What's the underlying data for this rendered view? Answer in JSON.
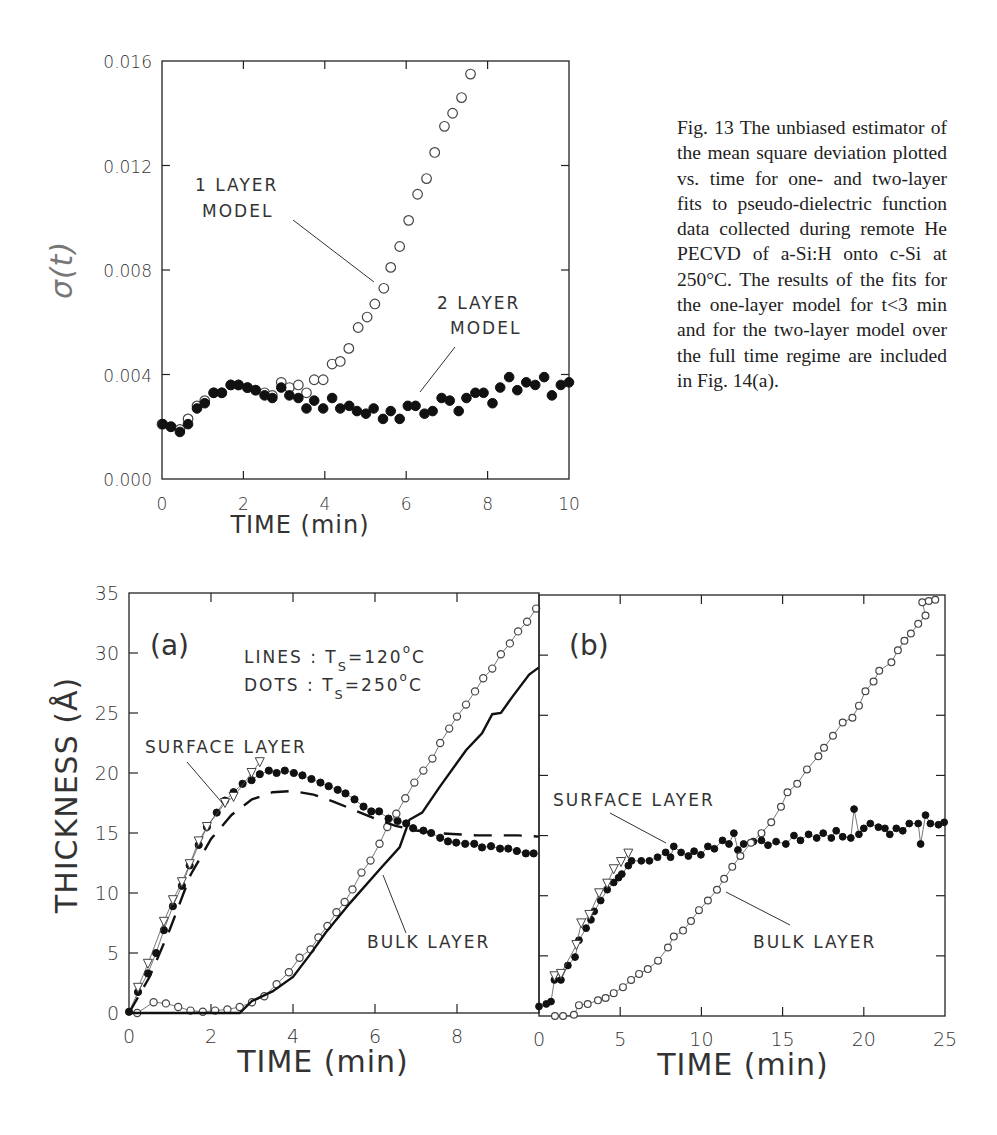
{
  "caption": "Fig. 13    The unbiased estimator of the mean square deviation plotted vs. time for one- and two-layer fits to pseudo-dielectric function data collected during remote He PECVD of a-Si:H onto c-Si at 250°C. The results of the fits for the one-layer model for t<3 min and for the two-layer model over the full time regime are included in Fig. 14(a).",
  "chart_data": [
    {
      "id": "fig13",
      "type": "scatter",
      "title": "",
      "xlabel": "TIME (min)",
      "ylabel": "σ(t)",
      "xlim": [
        0,
        10
      ],
      "ylim": [
        0.0,
        0.016
      ],
      "xticks": [
        0,
        2,
        4,
        6,
        8,
        10
      ],
      "xtick_labels": [
        "0",
        "2",
        "4",
        "6",
        "8",
        "10"
      ],
      "yticks": [
        0.0,
        0.004,
        0.008,
        0.012,
        0.016
      ],
      "ytick_labels": [
        "0.000",
        "0.004",
        "0.008",
        "0.012",
        "0.016"
      ],
      "grid": false,
      "annotations": [
        {
          "text": [
            "1 LAYER",
            "MODEL"
          ],
          "points_to": "1 layer model"
        },
        {
          "text": [
            "2 LAYER",
            "MODEL"
          ],
          "points_to": "2 layer model"
        }
      ],
      "series": [
        {
          "name": "1 layer model",
          "marker": "open-circle",
          "x": [
            0.0,
            0.22,
            0.44,
            0.64,
            0.86,
            1.05,
            1.27,
            1.47,
            1.69,
            1.88,
            2.1,
            2.3,
            2.52,
            2.71,
            2.93,
            3.13,
            3.35,
            3.55,
            3.74,
            3.96,
            4.18,
            4.38,
            4.59,
            4.82,
            5.04,
            5.23,
            5.45,
            5.62,
            5.84,
            6.06,
            6.28,
            6.5,
            6.7,
            6.94,
            7.14,
            7.36,
            7.58
          ],
          "y": [
            0.0021,
            0.002,
            0.0019,
            0.0023,
            0.0028,
            0.003,
            0.0033,
            0.0033,
            0.0036,
            0.0036,
            0.0035,
            0.0034,
            0.0033,
            0.0032,
            0.0037,
            0.0035,
            0.0036,
            0.0033,
            0.0038,
            0.0038,
            0.0044,
            0.0045,
            0.005,
            0.0058,
            0.0062,
            0.0067,
            0.0073,
            0.0081,
            0.0089,
            0.0099,
            0.0109,
            0.0115,
            0.0125,
            0.0135,
            0.014,
            0.0146,
            0.0155
          ]
        },
        {
          "name": "2 layer model",
          "marker": "filled-circle",
          "x": [
            0.02,
            0.22,
            0.44,
            0.64,
            0.86,
            1.05,
            1.27,
            1.47,
            1.69,
            1.88,
            2.1,
            2.3,
            2.52,
            2.71,
            2.93,
            3.13,
            3.35,
            3.55,
            3.74,
            3.96,
            4.18,
            4.38,
            4.6,
            4.79,
            5.01,
            5.2,
            5.43,
            5.62,
            5.84,
            6.04,
            6.23,
            6.45,
            6.65,
            6.87,
            7.07,
            7.29,
            7.48,
            7.7,
            7.9,
            8.12,
            8.31,
            8.53,
            8.73,
            8.95,
            9.17,
            9.39,
            9.58,
            9.8,
            10.0
          ],
          "y": [
            0.0021,
            0.002,
            0.0018,
            0.0021,
            0.0027,
            0.0029,
            0.0033,
            0.0033,
            0.0036,
            0.0036,
            0.0035,
            0.0034,
            0.0032,
            0.0031,
            0.0035,
            0.0032,
            0.0031,
            0.0027,
            0.003,
            0.0027,
            0.0031,
            0.0027,
            0.0028,
            0.0026,
            0.0025,
            0.0027,
            0.0023,
            0.0026,
            0.0023,
            0.0028,
            0.0028,
            0.0025,
            0.0026,
            0.0031,
            0.003,
            0.0026,
            0.0031,
            0.0033,
            0.0033,
            0.0029,
            0.0035,
            0.0039,
            0.0034,
            0.0037,
            0.0036,
            0.0039,
            0.0032,
            0.0036,
            0.0037
          ]
        }
      ]
    },
    {
      "id": "fig14a",
      "type": "line",
      "panel_label": "(a)",
      "xlabel": "TIME (min)",
      "ylabel": "THICKNESS (Å)",
      "xlim": [
        0,
        10
      ],
      "ylim": [
        0,
        35
      ],
      "xticks": [
        0,
        2,
        4,
        6,
        8,
        10
      ],
      "xtick_labels": [
        "0",
        "2",
        "4",
        "6",
        "8",
        "0"
      ],
      "yticks": [
        0,
        5,
        10,
        15,
        20,
        25,
        30,
        35
      ],
      "ytick_labels": [
        "0",
        "5",
        "10",
        "15",
        "20",
        "25",
        "30",
        "35"
      ],
      "grid": false,
      "legend_text": [
        {
          "label": "LINES",
          "sep": ":",
          "var": "T",
          "sub": "S",
          "eq": "=120",
          "deg": "o",
          "unit": "C"
        },
        {
          "label": "DOTS",
          "sep": ":",
          "var": "T",
          "sub": "S",
          "eq": "=250",
          "deg": "o",
          "unit": "C"
        }
      ],
      "annotations": [
        {
          "text": "SURFACE LAYER"
        },
        {
          "text": "BULK LAYER"
        }
      ],
      "series": [
        {
          "name": "surface layer, 250°C (dots)",
          "marker": "filled-circle",
          "x": [
            0.0,
            0.22,
            0.46,
            0.66,
            0.85,
            1.07,
            1.29,
            1.48,
            1.7,
            1.9,
            2.14,
            2.34,
            2.55,
            2.77,
            2.99,
            3.19,
            3.41,
            3.6,
            3.8,
            4.02,
            4.23,
            4.45,
            4.67,
            4.87,
            5.09,
            5.28,
            5.5,
            5.72,
            5.91,
            6.1,
            6.33,
            6.55,
            6.76,
            6.93,
            7.18,
            7.37,
            7.59,
            7.78,
            7.98,
            8.2,
            8.42,
            8.61,
            8.83,
            9.05,
            9.25,
            9.46,
            9.68,
            9.87
          ],
          "y": [
            0.1,
            1.75,
            3.3,
            5.0,
            6.9,
            8.9,
            10.6,
            12.3,
            14.0,
            15.5,
            16.7,
            17.7,
            18.4,
            19.1,
            19.4,
            19.9,
            20.2,
            20.0,
            20.2,
            20.0,
            19.8,
            19.5,
            19.2,
            18.9,
            18.6,
            18.3,
            17.8,
            17.2,
            16.8,
            16.8,
            16.2,
            16.0,
            15.8,
            15.4,
            15.2,
            15.0,
            14.6,
            14.3,
            14.2,
            14.1,
            14.1,
            13.8,
            13.9,
            13.7,
            13.7,
            13.5,
            13.3,
            13.3
          ]
        },
        {
          "name": "surface layer, 250°C (open triangles)",
          "marker": "open-triangle",
          "x": [
            0.22,
            0.46,
            0.85,
            1.07,
            1.29,
            1.48,
            1.7,
            1.9,
            2.34,
            2.55,
            2.99,
            3.19
          ],
          "y": [
            2.1,
            4.1,
            7.6,
            9.4,
            10.9,
            12.4,
            14.3,
            15.5,
            17.5,
            18.0,
            20.0,
            20.9
          ]
        },
        {
          "name": "bulk layer, 250°C (dots)",
          "marker": "open-circle",
          "x": [
            0.2,
            0.6,
            0.9,
            1.2,
            1.5,
            1.8,
            2.1,
            2.4,
            2.7,
            3.0,
            3.3,
            3.6,
            3.9,
            4.16,
            4.43,
            4.62,
            4.84,
            5.06,
            5.26,
            5.45,
            5.67,
            5.89,
            6.11,
            6.3,
            6.52,
            6.74,
            6.96,
            7.18,
            7.4,
            7.59,
            7.81,
            8.0,
            8.22,
            8.44,
            8.64,
            8.86,
            9.07,
            9.29,
            9.49,
            9.71,
            9.93
          ],
          "y": [
            0.0,
            0.9,
            0.8,
            0.5,
            0.2,
            0.1,
            0.2,
            0.3,
            0.5,
            0.9,
            1.4,
            2.4,
            3.4,
            4.6,
            5.3,
            6.3,
            7.25,
            8.4,
            9.25,
            10.3,
            11.7,
            12.7,
            14.1,
            15.5,
            16.6,
            17.9,
            19.2,
            20.2,
            21.2,
            22.5,
            23.7,
            24.7,
            25.7,
            26.8,
            27.9,
            28.7,
            29.9,
            30.8,
            31.8,
            32.6,
            33.7
          ]
        },
        {
          "name": "surface layer, 120°C (lines)",
          "line": "dashed",
          "x": [
            0.0,
            0.5,
            1.0,
            1.5,
            2.0,
            2.5,
            3.0,
            3.5,
            4.0,
            4.5,
            5.0,
            5.5,
            6.0,
            6.5,
            7.0,
            7.5,
            8.0,
            8.5,
            9.0,
            9.5,
            10.0
          ],
          "y": [
            0.0,
            3.0,
            7.0,
            11.5,
            14.5,
            16.5,
            17.8,
            18.4,
            18.5,
            18.2,
            17.6,
            16.9,
            16.2,
            15.6,
            15.2,
            15.0,
            14.9,
            14.8,
            14.8,
            14.8,
            14.7
          ]
        },
        {
          "name": "bulk layer, 120°C (lines)",
          "line": "solid",
          "x": [
            0.0,
            2.7,
            3.0,
            3.5,
            4.0,
            4.4,
            4.8,
            5.4,
            6.15,
            6.6,
            6.84,
            7.15,
            7.57,
            8.22,
            8.61,
            8.86,
            9.07,
            9.34,
            9.76,
            10.0
          ],
          "y": [
            0.0,
            0.0,
            1.0,
            1.8,
            3.0,
            4.8,
            6.7,
            9.2,
            12.1,
            13.8,
            16.1,
            16.7,
            18.8,
            21.9,
            23.3,
            24.9,
            25.0,
            26.3,
            28.2,
            28.8
          ]
        }
      ]
    },
    {
      "id": "fig14b",
      "type": "line",
      "panel_label": "(b)",
      "xlabel": "TIME (min)",
      "ylabel": "THICKNESS (Å)",
      "xlim": [
        0,
        25
      ],
      "ylim": [
        0,
        35
      ],
      "xticks": [
        0,
        5,
        10,
        15,
        20,
        25
      ],
      "xtick_labels": [
        "0",
        "5",
        "10",
        "15",
        "20",
        "25"
      ],
      "yticks": [
        0,
        5,
        10,
        15,
        20,
        25,
        30,
        35
      ],
      "grid": false,
      "annotations": [
        {
          "text": "SURFACE LAYER"
        },
        {
          "text": "BULK LAYER"
        }
      ],
      "series": [
        {
          "name": "surface layer (filled)",
          "marker": "filled-circle",
          "x": [
            0.0,
            0.45,
            0.74,
            0.95,
            1.35,
            1.78,
            2.22,
            2.46,
            2.9,
            3.2,
            3.4,
            3.8,
            4.2,
            4.6,
            4.9,
            5.1,
            5.5,
            5.7,
            6.3,
            6.8,
            7.3,
            7.8,
            8.1,
            8.3,
            8.75,
            9.2,
            9.55,
            9.97,
            10.4,
            10.8,
            11.3,
            11.7,
            12.0,
            12.25,
            12.6,
            13.2,
            13.7,
            14.1,
            14.6,
            15.2,
            15.7,
            16.1,
            16.6,
            17.1,
            17.5,
            18.0,
            18.3,
            18.7,
            19.2,
            19.4,
            19.7,
            20.0,
            20.4,
            20.9,
            21.3,
            21.6,
            22.0,
            22.4,
            22.8,
            23.35,
            23.5,
            23.8,
            24.1,
            24.6,
            24.95
          ],
          "y": [
            0.8,
            1.0,
            1.2,
            3.0,
            3.0,
            4.2,
            4.9,
            6.3,
            7.3,
            8.0,
            8.7,
            9.6,
            10.5,
            11.1,
            11.5,
            11.8,
            12.5,
            12.9,
            12.9,
            12.9,
            13.2,
            13.6,
            13.2,
            14.1,
            13.6,
            13.3,
            13.7,
            13.4,
            14.1,
            13.9,
            14.6,
            14.3,
            15.2,
            13.8,
            14.3,
            14.5,
            14.6,
            14.2,
            14.5,
            14.3,
            15.0,
            14.6,
            15.1,
            14.8,
            15.2,
            14.8,
            15.4,
            14.9,
            14.8,
            17.2,
            15.1,
            15.6,
            16.0,
            15.7,
            15.6,
            15.1,
            15.6,
            15.4,
            16.0,
            16.0,
            14.3,
            16.7,
            16.0,
            15.9,
            16.1
          ]
        },
        {
          "name": "surface layer (open triangles)",
          "marker": "open-triangle",
          "x": [
            0.95,
            1.35,
            2.3,
            2.6,
            3.1,
            3.7,
            4.2,
            4.6,
            5.05,
            5.5
          ],
          "y": [
            3.3,
            3.5,
            5.9,
            7.7,
            8.4,
            10.2,
            11.0,
            12.2,
            12.8,
            13.5
          ]
        },
        {
          "name": "bulk layer (open circles)",
          "marker": "open-circle",
          "x": [
            0.98,
            1.48,
            2.15,
            2.46,
            3.0,
            3.63,
            4.1,
            4.6,
            5.17,
            5.67,
            6.16,
            6.7,
            7.33,
            7.94,
            8.3,
            8.87,
            9.36,
            9.85,
            10.4,
            10.96,
            11.4,
            11.9,
            12.4,
            13.05,
            13.7,
            14.3,
            14.9,
            15.3,
            15.9,
            16.5,
            17.2,
            17.55,
            18.1,
            18.7,
            19.3,
            19.7,
            20.1,
            20.6,
            20.95,
            21.7,
            22.1,
            22.5,
            22.9,
            23.35,
            23.8,
            23.6,
            24.0,
            24.4
          ],
          "y": [
            0.0,
            0.0,
            0.1,
            0.9,
            1.0,
            1.3,
            1.5,
            1.9,
            2.4,
            3.0,
            3.5,
            3.9,
            4.6,
            5.7,
            6.6,
            7.1,
            7.9,
            8.8,
            9.6,
            10.5,
            11.4,
            12.4,
            13.3,
            14.4,
            15.2,
            16.1,
            17.4,
            18.6,
            19.3,
            20.5,
            21.6,
            22.3,
            23.3,
            24.4,
            24.8,
            25.8,
            27.0,
            27.8,
            28.7,
            29.4,
            30.4,
            31.2,
            31.8,
            32.6,
            33.3,
            34.4,
            34.5,
            34.6
          ]
        }
      ]
    }
  ]
}
